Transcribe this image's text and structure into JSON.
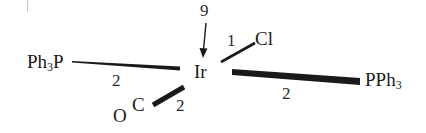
{
  "diagram": {
    "type": "coordination-complex-structure",
    "center_atom": {
      "label": "Ir"
    },
    "top_annotation": {
      "label": "9"
    },
    "ligands": [
      {
        "id": "cl",
        "label": "Cl",
        "bond_label": "1",
        "direction": "upper-right"
      },
      {
        "id": "pph3-left",
        "prefix": "Ph",
        "sub": "3",
        "suffix": "P",
        "bond_label": "2",
        "direction": "left"
      },
      {
        "id": "pph3-right",
        "prefix": "PPh",
        "sub": "3",
        "suffix": "",
        "bond_label": "2",
        "direction": "right"
      },
      {
        "id": "co",
        "label_o": "O",
        "label_c": "C",
        "bond_label": "2",
        "direction": "lower-left"
      }
    ],
    "colors": {
      "ink": "#1a1a1a",
      "background": "#ffffff",
      "artifact": "#c8c8c8"
    }
  }
}
